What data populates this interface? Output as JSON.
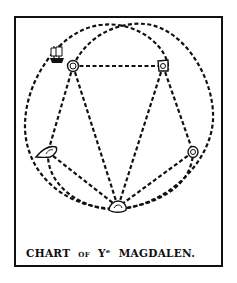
{
  "caption": {
    "word1": "CHART",
    "word2": "OF",
    "word3": "Yᵉ",
    "word4": "MAGDALEN."
  },
  "colors": {
    "ink": "#111111",
    "paper": "#ffffff"
  },
  "diagram": {
    "islands": [
      {
        "id": "island-1",
        "label": "north-west island with ship"
      },
      {
        "id": "island-2",
        "label": "north-east island"
      },
      {
        "id": "island-3",
        "label": "west island"
      },
      {
        "id": "island-4",
        "label": "east island"
      },
      {
        "id": "island-5",
        "label": "south island"
      }
    ],
    "routes": [
      {
        "from": "island-1",
        "to": "island-2"
      },
      {
        "from": "island-1",
        "to": "island-3"
      },
      {
        "from": "island-1",
        "to": "island-5"
      },
      {
        "from": "island-2",
        "to": "island-4"
      },
      {
        "from": "island-2",
        "to": "island-5"
      },
      {
        "from": "island-3",
        "to": "island-5"
      },
      {
        "from": "island-4",
        "to": "island-5"
      }
    ],
    "ship": {
      "icon": "ship-icon",
      "at": "island-1"
    }
  }
}
